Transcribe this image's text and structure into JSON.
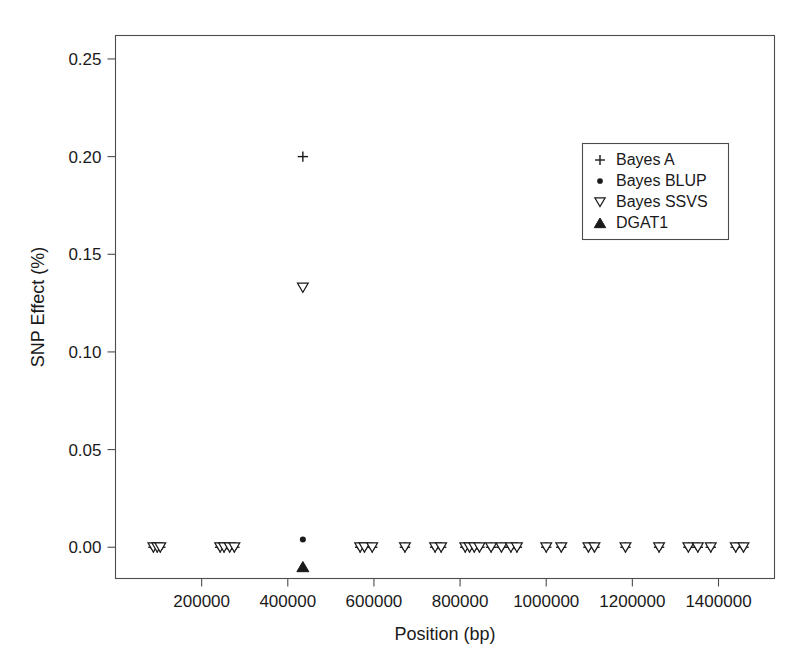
{
  "chart_data": {
    "type": "scatter",
    "title": "",
    "xlabel": "Position (bp)",
    "ylabel": "SNP Effect (%)",
    "xlim": [
      0,
      1530000
    ],
    "ylim": [
      -0.016,
      0.262
    ],
    "grid": false,
    "legend_position": "top-right",
    "xticks": [
      200000,
      400000,
      600000,
      800000,
      1000000,
      1200000,
      1400000
    ],
    "xtick_labels": [
      "200000",
      "400000",
      "600000",
      "800000",
      "1000000",
      "1200000",
      "1400000"
    ],
    "yticks": [
      0.0,
      0.05,
      0.1,
      0.15,
      0.2,
      0.25
    ],
    "ytick_labels": [
      "0.00",
      "0.05",
      "0.10",
      "0.15",
      "0.20",
      "0.25"
    ],
    "series": [
      {
        "name": "Bayes A",
        "marker": "plus",
        "color": "#1a1a1a",
        "points": [
          [
            88000,
            0.0
          ],
          [
            97000,
            0.0
          ],
          [
            104000,
            0.0
          ],
          [
            243000,
            0.0
          ],
          [
            252000,
            0.0
          ],
          [
            265000,
            0.0
          ],
          [
            276000,
            0.0
          ],
          [
            435000,
            0.2
          ],
          [
            568000,
            0.0
          ],
          [
            578000,
            0.0
          ],
          [
            596000,
            0.0
          ],
          [
            672000,
            0.0
          ],
          [
            742000,
            0.0
          ],
          [
            756000,
            0.0
          ],
          [
            812000,
            0.0
          ],
          [
            822000,
            0.0
          ],
          [
            833000,
            0.0
          ],
          [
            845000,
            0.0
          ],
          [
            872000,
            0.0
          ],
          [
            896000,
            0.0
          ],
          [
            918000,
            0.0
          ],
          [
            932000,
            0.0
          ],
          [
            1000000,
            0.0
          ],
          [
            1035000,
            0.0
          ],
          [
            1098000,
            0.0
          ],
          [
            1112000,
            0.0
          ],
          [
            1184000,
            0.0
          ],
          [
            1262000,
            0.0
          ],
          [
            1330000,
            0.0
          ],
          [
            1352000,
            0.0
          ],
          [
            1382000,
            0.0
          ],
          [
            1440000,
            0.0
          ],
          [
            1458000,
            0.0
          ]
        ]
      },
      {
        "name": "Bayes BLUP",
        "marker": "dot",
        "color": "#1a1a1a",
        "points": [
          [
            88000,
            0.0
          ],
          [
            97000,
            0.0
          ],
          [
            104000,
            0.0
          ],
          [
            243000,
            0.0
          ],
          [
            252000,
            0.0
          ],
          [
            265000,
            0.0
          ],
          [
            276000,
            0.0
          ],
          [
            435000,
            0.004
          ],
          [
            568000,
            0.0
          ],
          [
            578000,
            0.0
          ],
          [
            596000,
            0.0
          ],
          [
            672000,
            0.0
          ],
          [
            742000,
            0.0
          ],
          [
            756000,
            0.0
          ],
          [
            812000,
            0.0
          ],
          [
            822000,
            0.0
          ],
          [
            833000,
            0.0
          ],
          [
            845000,
            0.0
          ],
          [
            872000,
            0.0
          ],
          [
            896000,
            0.0
          ],
          [
            918000,
            0.0
          ],
          [
            932000,
            0.0
          ],
          [
            1000000,
            0.0
          ],
          [
            1035000,
            0.0
          ],
          [
            1098000,
            0.0
          ],
          [
            1112000,
            0.0
          ],
          [
            1184000,
            0.0
          ],
          [
            1262000,
            0.0
          ],
          [
            1330000,
            0.0
          ],
          [
            1352000,
            0.0
          ],
          [
            1382000,
            0.0
          ],
          [
            1440000,
            0.0
          ],
          [
            1458000,
            0.0
          ]
        ]
      },
      {
        "name": "Bayes SSVS",
        "marker": "triangle-down-open",
        "color": "#1a1a1a",
        "points": [
          [
            88000,
            0.0
          ],
          [
            97000,
            0.0
          ],
          [
            104000,
            0.0
          ],
          [
            243000,
            0.0
          ],
          [
            252000,
            0.0
          ],
          [
            265000,
            0.0
          ],
          [
            276000,
            0.0
          ],
          [
            435000,
            0.133
          ],
          [
            568000,
            0.0
          ],
          [
            578000,
            0.0
          ],
          [
            596000,
            0.0
          ],
          [
            672000,
            0.0
          ],
          [
            742000,
            0.0
          ],
          [
            756000,
            0.0
          ],
          [
            812000,
            0.0
          ],
          [
            822000,
            0.0
          ],
          [
            833000,
            0.0
          ],
          [
            845000,
            0.0
          ],
          [
            872000,
            0.0
          ],
          [
            896000,
            0.0
          ],
          [
            918000,
            0.0
          ],
          [
            932000,
            0.0
          ],
          [
            1000000,
            0.0
          ],
          [
            1035000,
            0.0
          ],
          [
            1098000,
            0.0
          ],
          [
            1112000,
            0.0
          ],
          [
            1184000,
            0.0
          ],
          [
            1262000,
            0.0
          ],
          [
            1330000,
            0.0
          ],
          [
            1352000,
            0.0
          ],
          [
            1382000,
            0.0
          ],
          [
            1440000,
            0.0
          ],
          [
            1458000,
            0.0
          ]
        ]
      },
      {
        "name": "DGAT1",
        "marker": "triangle-up-filled",
        "color": "#1a1a1a",
        "points": [
          [
            435000,
            -0.01
          ]
        ]
      }
    ],
    "legend_entries": [
      {
        "label": "Bayes A",
        "marker": "plus"
      },
      {
        "label": "Bayes BLUP",
        "marker": "dot"
      },
      {
        "label": "Bayes SSVS",
        "marker": "triangle-down-open"
      },
      {
        "label": "DGAT1",
        "marker": "triangle-up-filled"
      }
    ]
  }
}
